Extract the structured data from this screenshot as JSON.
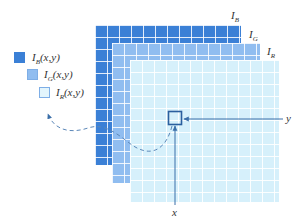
{
  "diagram": {
    "layers": [
      {
        "id": "B",
        "label_base": "I",
        "label_sub": "B",
        "color": "#3b80d6"
      },
      {
        "id": "G",
        "label_base": "I",
        "label_sub": "G",
        "color": "#90bdf0"
      },
      {
        "id": "R",
        "label_base": "I",
        "label_sub": "R",
        "color": "#d6f0fb"
      }
    ],
    "legend": [
      {
        "base": "I",
        "sub": "B",
        "args": "(x,y)",
        "color": "#3b80d6"
      },
      {
        "base": "I",
        "sub": "G",
        "args": "(x,y)",
        "color": "#90bdf0"
      },
      {
        "base": "I",
        "sub": "R",
        "args": "(x,y)",
        "color": "#e3f5fc"
      }
    ],
    "axes": {
      "x_label": "x",
      "y_label": "y",
      "axis_color": "#3a6ea8"
    },
    "highlight": {
      "description": "selected pixel (x,y)",
      "border_color": "#2b5f9e"
    },
    "connector": {
      "style": "dashed",
      "color": "#5b87b8"
    }
  }
}
